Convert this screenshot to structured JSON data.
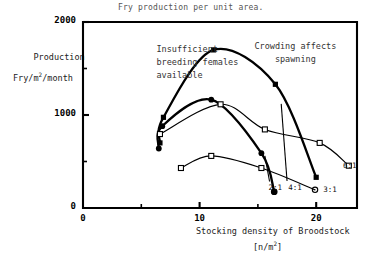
{
  "chart_data": {
    "type": "line",
    "title": "Fry production per unit area.",
    "xlabel": "Stocking density of Broodstock",
    "xunit": "[n/m2]",
    "ylabel_line1": "Production",
    "ylabel_line2": "Fry/m2/month",
    "xlim": [
      0,
      23.5
    ],
    "ylim": [
      0,
      2000
    ],
    "xticks": [
      0,
      10,
      20
    ],
    "xtick_labels": [
      "0",
      "10",
      "20"
    ],
    "yticks": [
      0,
      1000,
      2000
    ],
    "ytick_labels": [
      "0",
      "1000",
      "2000"
    ],
    "yminor_ticks": [
      500,
      1500
    ],
    "grid": false,
    "legend_position": "inline-end-of-curve",
    "annotations": [
      {
        "name": "left-annotation",
        "line1": "Insufficient",
        "line2": "breeding females",
        "line3": "available",
        "x": 7.5,
        "y": 1750
      },
      {
        "name": "right-annotation",
        "line1": "Crowding affects",
        "line2": "spawning",
        "line3": "",
        "x": 18.0,
        "y": 1780
      }
    ],
    "series": [
      {
        "name": "4:1",
        "label": "4:1",
        "marker": "filled-square",
        "line_width": "thick",
        "points": [
          {
            "x": 6.6,
            "y": 700
          },
          {
            "x": 6.9,
            "y": 975
          },
          {
            "x": 11.2,
            "y": 1700
          },
          {
            "x": 16.5,
            "y": 1330
          },
          {
            "x": 20.0,
            "y": 330
          }
        ],
        "label_x": 17.6,
        "label_y": 215
      },
      {
        "name": "2:1",
        "label": "2:1",
        "marker": "filled-circle",
        "line_width": "thick",
        "points": [
          {
            "x": 6.5,
            "y": 640
          },
          {
            "x": 6.8,
            "y": 880
          },
          {
            "x": 11.0,
            "y": 1165
          },
          {
            "x": 15.3,
            "y": 590
          },
          {
            "x": 16.4,
            "y": 175
          }
        ],
        "label_x": 15.9,
        "label_y": 215
      },
      {
        "name": "6:1",
        "label": "6:1",
        "marker": "open-square",
        "line_width": "thin",
        "points": [
          {
            "x": 6.6,
            "y": 795
          },
          {
            "x": 11.8,
            "y": 1115
          },
          {
            "x": 15.6,
            "y": 845
          },
          {
            "x": 20.3,
            "y": 700
          },
          {
            "x": 22.8,
            "y": 455
          }
        ],
        "label_x": 22.3,
        "label_y": 455
      },
      {
        "name": "3:1",
        "label": "3:1",
        "marker": "open-square",
        "line_width": "thin",
        "points": [
          {
            "x": 8.4,
            "y": 430
          },
          {
            "x": 11.0,
            "y": 560
          },
          {
            "x": 15.3,
            "y": 430
          },
          {
            "x": 19.9,
            "y": 195
          }
        ],
        "label_x": 20.6,
        "label_y": 195
      }
    ]
  }
}
